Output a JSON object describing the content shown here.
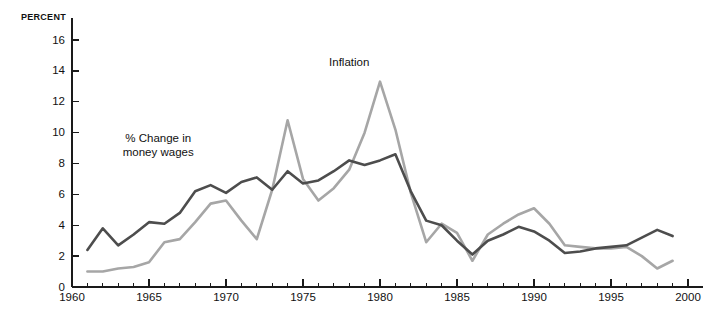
{
  "chart_data": {
    "type": "line",
    "title": "",
    "xlabel": "",
    "ylabel": "PERCENT",
    "xlim": [
      1960,
      2000
    ],
    "ylim": [
      0,
      17
    ],
    "grid": false,
    "legend_position": "inline-annotations",
    "x_major_ticks": [
      1960,
      1965,
      1970,
      1975,
      1980,
      1985,
      1990,
      1995,
      2000
    ],
    "x_tick_labels": [
      "1960",
      "1965",
      "1970",
      "1975",
      "1980",
      "1985",
      "1990",
      "1995",
      "2000"
    ],
    "x_minor_tick_interval": 1,
    "y_major_ticks": [
      0,
      2,
      4,
      6,
      8,
      10,
      12,
      14,
      16
    ],
    "y_tick_labels": [
      "0",
      "2",
      "4",
      "6",
      "8",
      "10",
      "12",
      "14",
      "16"
    ],
    "x": [
      1961,
      1962,
      1963,
      1964,
      1965,
      1966,
      1967,
      1968,
      1969,
      1970,
      1971,
      1972,
      1973,
      1974,
      1975,
      1976,
      1977,
      1978,
      1979,
      1980,
      1981,
      1982,
      1983,
      1984,
      1985,
      1986,
      1987,
      1988,
      1989,
      1990,
      1991,
      1992,
      1993,
      1994,
      1995,
      1996,
      1997,
      1998,
      1999
    ],
    "series": [
      {
        "name": "% Change in money wages",
        "color": "#4d4d4d",
        "values": [
          2.4,
          3.8,
          2.7,
          3.4,
          4.2,
          4.1,
          4.8,
          6.2,
          6.6,
          6.1,
          6.8,
          7.1,
          6.3,
          7.5,
          6.7,
          6.9,
          7.5,
          8.2,
          7.9,
          8.2,
          8.6,
          6.2,
          4.3,
          4.0,
          3.0,
          2.1,
          3.0,
          3.4,
          3.9,
          3.6,
          3.0,
          2.2,
          2.3,
          2.5,
          2.6,
          2.7,
          3.2,
          3.7,
          3.3
        ]
      },
      {
        "name": "Inflation",
        "color": "#a6a6a6",
        "values": [
          1.0,
          1.0,
          1.2,
          1.3,
          1.6,
          2.9,
          3.1,
          4.2,
          5.4,
          5.6,
          4.3,
          3.1,
          6.3,
          10.8,
          7.0,
          5.6,
          6.4,
          7.6,
          10.0,
          13.3,
          10.2,
          6.1,
          2.9,
          4.1,
          3.5,
          1.7,
          3.4,
          4.1,
          4.7,
          5.1,
          4.1,
          2.7,
          2.6,
          2.5,
          2.5,
          2.6,
          2.0,
          1.2,
          1.7
        ]
      }
    ],
    "annotations": [
      {
        "name": "inflation-label",
        "text": "Inflation",
        "x": 1978.0,
        "y": 14.3
      },
      {
        "name": "wages-label-line1",
        "text": "% Change in",
        "x": 1965.6,
        "y": 9.4
      },
      {
        "name": "wages-label-line2",
        "text": "money wages",
        "x": 1965.6,
        "y": 8.5
      }
    ]
  }
}
